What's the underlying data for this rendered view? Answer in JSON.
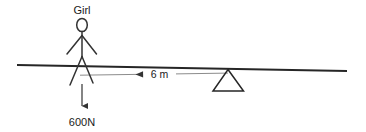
{
  "diagram": {
    "type": "physics-free-body-lever",
    "colors": {
      "background": "#ffffff",
      "plank_line": "#262626",
      "figure_line": "#333333",
      "dimension_line": "#888888",
      "text": "#1a1a1a"
    },
    "labels": {
      "person": "Girl",
      "force": "600N",
      "distance": "6 m"
    },
    "elements": {
      "person_icon": "stick-figure-icon",
      "fulcrum_icon": "triangle-fulcrum-icon",
      "force_arrow_icon": "down-arrow-icon",
      "dimension_arrow_icon": "left-arrow-icon"
    },
    "geometry": {
      "plank": {
        "x1": 17,
        "y1": 65,
        "x2": 347,
        "y2": 71
      },
      "head": {
        "cx": 82,
        "cy": 25,
        "rx": 5.2,
        "ry": 6.5
      },
      "body": {
        "x1": 82,
        "y1": 31,
        "x2": 82,
        "y2": 57
      },
      "arm_left": {
        "x1": 82,
        "y1": 35,
        "x2": 67,
        "y2": 54
      },
      "arm_right": {
        "x1": 82,
        "y1": 35,
        "x2": 96,
        "y2": 54
      },
      "leg_left": {
        "x1": 82,
        "y1": 57,
        "x2": 70,
        "y2": 85
      },
      "leg_right": {
        "x1": 82,
        "y1": 57,
        "x2": 93,
        "y2": 83
      },
      "force_arrow": {
        "x1": 82,
        "y1": 84,
        "x2": 82,
        "y2": 107
      },
      "dimension_line": {
        "x1": 80,
        "y1": 75,
        "x2": 228,
        "y2": 73
      },
      "fulcrum": {
        "apex_x": 228,
        "apex_y": 70,
        "base_left_x": 214,
        "base_right_x": 243,
        "base_y": 91
      },
      "label_person_pos": {
        "x": 82,
        "y": 14
      },
      "label_force_pos": {
        "x": 82,
        "y": 125
      },
      "label_distance_pos": {
        "x": 152,
        "y": 77
      }
    }
  }
}
